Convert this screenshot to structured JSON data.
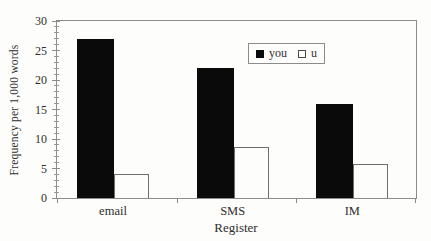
{
  "figure": {
    "background": "#fdfdfb"
  },
  "chart_data": {
    "type": "bar",
    "title": "",
    "categories": [
      "email",
      "SMS",
      "IM"
    ],
    "series": [
      {
        "name": "you",
        "style": "filled",
        "color": "#0a0a0a",
        "values": [
          27,
          22,
          16
        ]
      },
      {
        "name": "u",
        "style": "open",
        "color": "#ffffff",
        "values": [
          4,
          8.7,
          5.8
        ]
      }
    ],
    "xlabel": "Register",
    "ylabel": "Frequency per 1,000 words",
    "ylim": [
      0,
      30
    ],
    "yticks": [
      0,
      5,
      10,
      15,
      20,
      25,
      30
    ],
    "minor_tick_step": 1,
    "grid": "off",
    "legend": {
      "position": "inside-top-center",
      "boxed": true
    },
    "axis_color": "#8c8c8c",
    "text_color": "#2e2e2e"
  }
}
